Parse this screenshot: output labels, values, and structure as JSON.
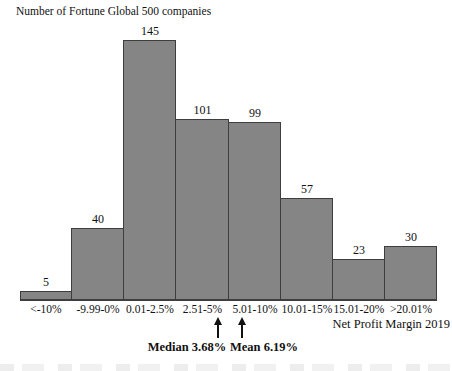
{
  "header": {
    "title": "Number of Fortune Global 500 companies"
  },
  "axis": {
    "x_label": "Net Profit Margin 2019"
  },
  "annotations": {
    "median_label": "Median 3.68%",
    "mean_label": "Mean 6.19%"
  },
  "colors": {
    "bar_fill": "#858585",
    "bar_border": "#3e3e3e",
    "text": "#111111"
  },
  "chart_data": {
    "type": "bar",
    "title": "Number of Fortune Global 500 companies",
    "categories": [
      "<-10%",
      "-9.99-0%",
      "0.01-2.5%",
      "2.51-5%",
      "5.01-10%",
      "10.01-15%",
      "15.01-20%",
      ">20.01%"
    ],
    "values": [
      5,
      40,
      145,
      101,
      99,
      57,
      23,
      30
    ],
    "xlabel": "Net Profit Margin 2019",
    "ylabel": "Number of Fortune Global 500 companies",
    "ylim": [
      0,
      145
    ],
    "grid": false,
    "legend_position": "none",
    "bar_gap": 0,
    "annotations": [
      {
        "text": "Median 3.68%",
        "value": 3.68
      },
      {
        "text": "Mean 6.19%",
        "value": 6.19
      }
    ]
  }
}
